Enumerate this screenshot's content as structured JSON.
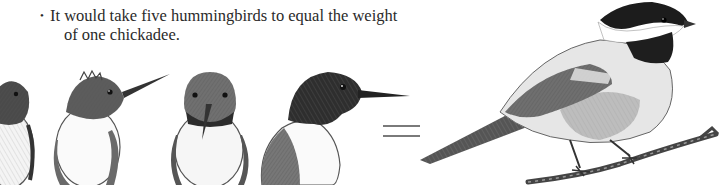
{
  "caption": {
    "bullet": "•",
    "line1": "It would take five hummingbirds to equal the weight",
    "line2": "of one chickadee."
  },
  "illustration": {
    "left_group": "hummingbirds",
    "hummingbird_count_visible": 4,
    "operator": "=",
    "right_subject": "black-capped chickadee on branch",
    "style": "pencil sketch, grayscale"
  },
  "colors": {
    "background": "#ffffff",
    "text": "#2a2a2a",
    "equals": "#7a7a7a",
    "dark": "#1e1e1e",
    "mid": "#7d7d7d",
    "light": "#d9d9d9"
  }
}
